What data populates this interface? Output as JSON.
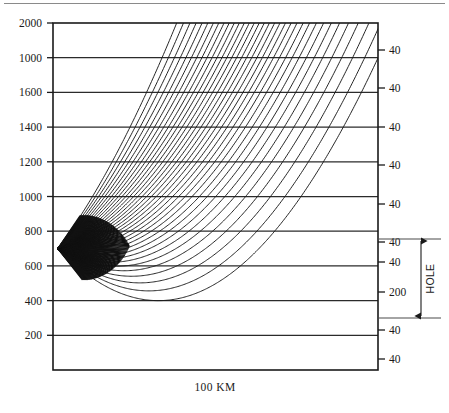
{
  "figure": {
    "name": "seismic-ray-path-diagram",
    "background_color": "#ffffff",
    "ink_color": "#1a1a1a",
    "grid_color": "#2b2b2b",
    "rule_color": "#8a8a8a"
  },
  "axes": {
    "left": {
      "label_name": "depth-axis",
      "ticks": [
        {
          "value": 2000,
          "label": "2000"
        },
        {
          "value": 1800,
          "label": "1000"
        },
        {
          "value": 1600,
          "label": "1600"
        },
        {
          "value": 1400,
          "label": "1400"
        },
        {
          "value": 1200,
          "label": "1200"
        },
        {
          "value": 1000,
          "label": "1000"
        },
        {
          "value": 800,
          "label": "800"
        },
        {
          "value": 600,
          "label": "600"
        },
        {
          "value": 400,
          "label": "400"
        },
        {
          "value": 200,
          "label": "200"
        }
      ]
    },
    "right": {
      "label_name": "velocity-axis",
      "ticks": [
        {
          "y_px": 50,
          "label": "40"
        },
        {
          "y_px": 88,
          "label": "40"
        },
        {
          "y_px": 127,
          "label": "40"
        },
        {
          "y_px": 165,
          "label": "40"
        },
        {
          "y_px": 204,
          "label": "40"
        },
        {
          "y_px": 242,
          "label": "40"
        },
        {
          "y_px": 262,
          "label": "40"
        },
        {
          "y_px": 292,
          "label": "200"
        },
        {
          "y_px": 330,
          "label": "40"
        },
        {
          "y_px": 359,
          "label": "40"
        }
      ]
    },
    "bottom": {
      "caption": "100 KM"
    }
  },
  "annotations": {
    "hole": {
      "text": "HOLE",
      "top_y_px": 239,
      "bottom_y_px": 318
    }
  },
  "chart_data": {
    "type": "line",
    "title": "",
    "xlabel": "100 KM",
    "ylabel": "",
    "ylim": [
      0,
      2000
    ],
    "xlim": [
      0,
      100
    ],
    "grid": true,
    "legend": "none",
    "source_point": {
      "x": 1.5,
      "y": 700
    },
    "ray_count": 34,
    "ray_launch_angles_deg": [
      -46,
      -43,
      -40,
      -37,
      -34,
      -31,
      -28,
      -25,
      -22,
      -19,
      -16,
      -13,
      -10,
      -7,
      -4,
      -1,
      2,
      5,
      8,
      11,
      14,
      17,
      20,
      23,
      26,
      29,
      32,
      35,
      38,
      41,
      44,
      47,
      50,
      53
    ],
    "gridline_values": [
      2000,
      1800,
      1600,
      1400,
      1200,
      1000,
      800,
      600,
      400,
      200
    ]
  }
}
